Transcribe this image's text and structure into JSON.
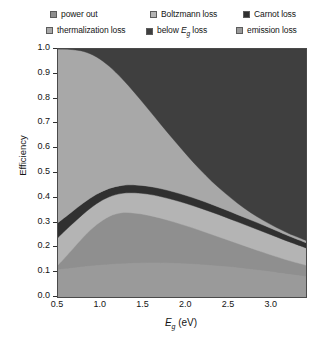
{
  "legend": {
    "rows": [
      [
        {
          "key": "power-out",
          "label": "power out",
          "color": "#8f8f8f"
        },
        {
          "key": "boltzmann-loss",
          "label": "Boltzmann loss",
          "color": "#b4b4b4"
        },
        {
          "key": "carnot-loss",
          "label": "Carnot loss",
          "color": "#303030"
        }
      ],
      [
        {
          "key": "thermalization-loss",
          "label": "thermalization loss",
          "color": "#a8a8a8"
        },
        {
          "key": "below-eg-loss",
          "label": "below Eg loss",
          "color": "#3f3f3f"
        },
        {
          "key": "emission-loss",
          "label": "emission loss",
          "color": "#9a9a9a"
        }
      ]
    ]
  },
  "axes": {
    "ylabel": "Efficiency",
    "xlabel_html": "Eg (eV)",
    "yticks": [
      "0.0",
      "0.1",
      "0.2",
      "0.3",
      "0.4",
      "0.5",
      "0.6",
      "0.7",
      "0.8",
      "0.9",
      "1.0"
    ],
    "xticks": [
      "0.5",
      "1.0",
      "1.5",
      "2.0",
      "2.5",
      "3.0"
    ],
    "ylim": [
      0.0,
      1.0
    ],
    "xlim": [
      0.5,
      3.4
    ]
  },
  "chart_data": {
    "type": "area",
    "title": "",
    "xlabel": "Eg (eV)",
    "ylabel": "Efficiency",
    "xlim": [
      0.5,
      3.4
    ],
    "ylim": [
      0.0,
      1.0
    ],
    "grid": false,
    "legend_position": "top",
    "stacking": "cumulative-from-bottom",
    "x": [
      0.5,
      0.65,
      0.8,
      0.95,
      1.1,
      1.25,
      1.4,
      1.55,
      1.7,
      1.85,
      2.0,
      2.15,
      2.3,
      2.45,
      2.6,
      2.75,
      2.9,
      3.05,
      3.2,
      3.4
    ],
    "series": [
      {
        "name": "emission loss",
        "color": "#9a9a9a",
        "comment": "bottom band: cumulative upper boundary",
        "values": [
          0.112,
          0.118,
          0.124,
          0.129,
          0.133,
          0.136,
          0.138,
          0.139,
          0.139,
          0.138,
          0.136,
          0.133,
          0.129,
          0.125,
          0.12,
          0.114,
          0.108,
          0.101,
          0.094,
          0.085
        ]
      },
      {
        "name": "power out",
        "color": "#8f8f8f",
        "comment": "cumulative upper boundary of power-out band",
        "values": [
          0.128,
          0.185,
          0.243,
          0.291,
          0.325,
          0.34,
          0.338,
          0.33,
          0.318,
          0.303,
          0.287,
          0.27,
          0.252,
          0.234,
          0.216,
          0.198,
          0.18,
          0.163,
          0.147,
          0.128
        ]
      },
      {
        "name": "Boltzmann loss",
        "color": "#b4b4b4",
        "comment": "cumulative upper boundary of Boltzmann band",
        "values": [
          0.24,
          0.289,
          0.336,
          0.376,
          0.404,
          0.418,
          0.42,
          0.415,
          0.405,
          0.392,
          0.377,
          0.36,
          0.342,
          0.323,
          0.303,
          0.283,
          0.263,
          0.243,
          0.223,
          0.198
        ]
      },
      {
        "name": "Carnot loss",
        "color": "#303030",
        "comment": "cumulative upper boundary of Carnot (thin dark) band",
        "values": [
          0.3,
          0.34,
          0.38,
          0.414,
          0.438,
          0.45,
          0.452,
          0.447,
          0.437,
          0.424,
          0.409,
          0.392,
          0.373,
          0.353,
          0.332,
          0.311,
          0.29,
          0.268,
          0.246,
          0.219
        ]
      },
      {
        "name": "thermalization loss",
        "color": "#a8a8a8",
        "comment": "cumulative upper boundary; above this is 'below Eg loss' up to 1.0",
        "values": [
          1.0,
          0.998,
          0.99,
          0.968,
          0.93,
          0.88,
          0.822,
          0.76,
          0.697,
          0.635,
          0.575,
          0.518,
          0.466,
          0.42,
          0.378,
          0.341,
          0.309,
          0.281,
          0.256,
          0.228
        ]
      },
      {
        "name": "below Eg loss",
        "color": "#3f3f3f",
        "comment": "top band filling remainder up to efficiency = 1.0",
        "values": [
          1.0,
          1.0,
          1.0,
          1.0,
          1.0,
          1.0,
          1.0,
          1.0,
          1.0,
          1.0,
          1.0,
          1.0,
          1.0,
          1.0,
          1.0,
          1.0,
          1.0,
          1.0,
          1.0,
          1.0
        ]
      }
    ]
  }
}
